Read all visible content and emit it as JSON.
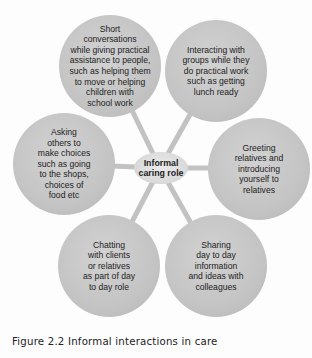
{
  "diagram": {
    "type": "spider-diagram",
    "center": {
      "label": "Informal\ncaring role"
    },
    "nodes": [
      {
        "id": "top-left",
        "label": "Short\nconversations\nwhile giving practical\nassistance to people,\nsuch as helping them\nto move or helping\nchildren with\nschool work"
      },
      {
        "id": "top-right",
        "label": "Interacting with\ngroups while they\ndo practical work\nsuch as getting\nlunch ready"
      },
      {
        "id": "right",
        "label": "Greeting\nrelatives and\nintroducing\nyourself to\nrelatives"
      },
      {
        "id": "bottom-right",
        "label": "Sharing\nday to day\ninformation\nand ideas with\ncolleagues"
      },
      {
        "id": "bottom-left",
        "label": "Chatting\nwith clients\nor relatives\nas part of day\nto day role"
      },
      {
        "id": "left",
        "label": "Asking\nothers to\nmake choices\nsuch as going\nto the shops,\nchoices of\nfood etc"
      }
    ],
    "colors": {
      "bubble": "#c4c4c4",
      "center": "#dcdcdc",
      "connector": "#c0c0c0",
      "text": "#222222"
    }
  },
  "caption": "Figure 2.2 Informal interactions in care"
}
